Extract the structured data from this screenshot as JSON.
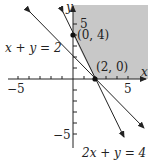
{
  "figure": {
    "type": "linear-inequality-graph",
    "x_axis_label": "x",
    "y_axis_label": "y",
    "tick_labels": {
      "x_neg": "−5",
      "x_pos": "5",
      "y_pos": "5",
      "y_neg": "−5"
    },
    "lines": [
      {
        "equation": "x + y = 2",
        "label": "x + y = 2"
      },
      {
        "equation": "2x + y = 4",
        "label": "2x + y = 4"
      }
    ],
    "points": [
      {
        "label": "(0, 4)",
        "x": 0,
        "y": 4
      },
      {
        "label": "(2, 0)",
        "x": 2,
        "y": 0
      }
    ],
    "shaded_region": {
      "description": "x ≥ 0, y ≥ 0, 2x + y ≥ 4",
      "color": "#c8c8c8"
    },
    "colors": {
      "line": "#222222",
      "axis": "#222222",
      "shade": "#c8c8c8"
    }
  }
}
